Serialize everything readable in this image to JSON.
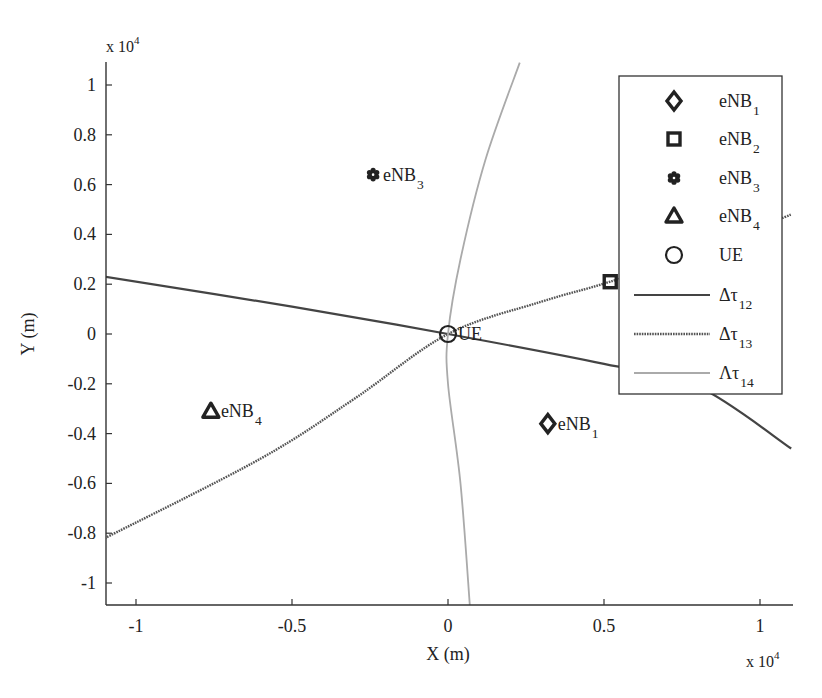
{
  "chart_data": {
    "type": "scatter",
    "title": "",
    "xlabel": "X (m)",
    "ylabel": "Y (m)",
    "x_multiplier": "x 10^4",
    "y_multiplier": "x 10^4",
    "xlim": [
      -1.1,
      1.1
    ],
    "ylim": [
      -1.09,
      1.09
    ],
    "xticks": [
      -1,
      -0.5,
      0,
      0.5,
      1
    ],
    "xtick_labels": [
      "-1",
      "-0.5",
      "0",
      "0.5",
      "1"
    ],
    "yticks": [
      -1,
      -0.8,
      -0.6,
      -0.4,
      -0.2,
      0,
      0.2,
      0.4,
      0.6,
      0.8,
      1
    ],
    "ytick_labels": [
      "-1",
      "-0.8",
      "-0.6",
      "-0.4",
      "-0.2",
      "0",
      "0.2",
      "0.4",
      "0.6",
      "0.8",
      "1"
    ],
    "grid": false,
    "legend_position": "upper right",
    "points": [
      {
        "name": "eNB1",
        "label": "eNB",
        "sub": "1",
        "marker": "diamond",
        "x": 0.32,
        "y": -0.36
      },
      {
        "name": "eNB2",
        "label": "eNB",
        "sub": "2",
        "marker": "square",
        "x": 0.52,
        "y": 0.21
      },
      {
        "name": "eNB3",
        "label": "eNB",
        "sub": "3",
        "marker": "hexagram",
        "x": -0.24,
        "y": 0.64
      },
      {
        "name": "eNB4",
        "label": "eNB",
        "sub": "4",
        "marker": "triangle",
        "x": -0.76,
        "y": -0.31
      },
      {
        "name": "UE",
        "label": "UE",
        "sub": "",
        "marker": "circle",
        "x": 0.0,
        "y": 0.0
      }
    ],
    "series": [
      {
        "name": "Δτ12",
        "label": "Δτ",
        "sub": "12",
        "style": "solid-dark",
        "x": [
          -1.1,
          -0.5,
          0.0,
          0.5,
          0.8,
          1.1
        ],
        "y": [
          0.23,
          0.11,
          0.0,
          -0.12,
          -0.21,
          -0.46
        ]
      },
      {
        "name": "Δτ13",
        "label": "Δτ",
        "sub": "13",
        "style": "dotted-dark",
        "x": [
          -1.1,
          -0.6,
          -0.3,
          0.0,
          0.3,
          0.52,
          0.8,
          1.1
        ],
        "y": [
          -0.82,
          -0.5,
          -0.26,
          0.0,
          0.13,
          0.21,
          0.33,
          0.48
        ]
      },
      {
        "name": "Δτ14",
        "label": "Λτ",
        "sub": "14",
        "style": "solid-light",
        "x": [
          0.07,
          0.04,
          0.0,
          0.0,
          0.04,
          0.12,
          0.23
        ],
        "y": [
          -1.09,
          -0.6,
          -0.2,
          0.0,
          0.3,
          0.7,
          1.09
        ]
      }
    ]
  },
  "axes": {
    "x_label": "X (m)",
    "y_label": "Y (m)",
    "x_exponent_base": "x 10",
    "x_exponent_power": "4",
    "y_exponent_base": "x 10",
    "y_exponent_power": "4"
  },
  "legend": {
    "items": [
      {
        "label": "eNB",
        "sub": "1",
        "marker": "diamond"
      },
      {
        "label": "eNB",
        "sub": "2",
        "marker": "square"
      },
      {
        "label": "eNB",
        "sub": "3",
        "marker": "hexagram"
      },
      {
        "label": "eNB",
        "sub": "4",
        "marker": "triangle"
      },
      {
        "label": "UE",
        "sub": "",
        "marker": "circle"
      },
      {
        "label": "Δτ",
        "sub": "12",
        "marker": "line-solid-dark"
      },
      {
        "label": "Δτ",
        "sub": "13",
        "marker": "line-dotted-dark"
      },
      {
        "label": "Λτ",
        "sub": "14",
        "marker": "line-light"
      }
    ]
  },
  "colors": {
    "axis": "#333333",
    "line12": "#444444",
    "line13": "#555555",
    "line14": "#aaaaaa",
    "marker": "#222222"
  }
}
